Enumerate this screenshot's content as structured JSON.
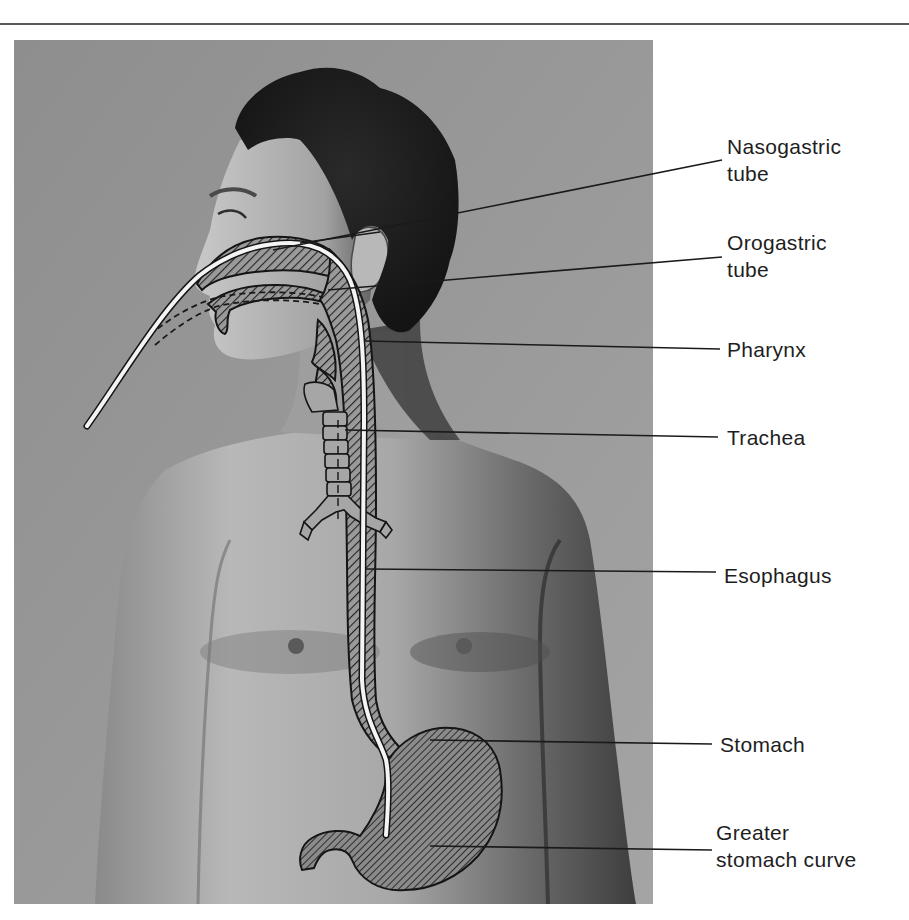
{
  "figure": {
    "type": "anatomical illustration",
    "photo_background_color": "#8f8f8f",
    "overlay_hatch_color": "#2a2a2a",
    "tube_color": "#f4f4f4"
  },
  "labels": [
    {
      "id": "nasogastric",
      "text": "Nasogastric\ntube",
      "x": 727,
      "y": 133
    },
    {
      "id": "orogastric",
      "text": "Orogastric\ntube",
      "x": 727,
      "y": 229
    },
    {
      "id": "pharynx",
      "text": "Pharynx",
      "x": 727,
      "y": 336
    },
    {
      "id": "trachea",
      "text": "Trachea",
      "x": 727,
      "y": 424
    },
    {
      "id": "esophagus",
      "text": "Esophagus",
      "x": 724,
      "y": 562
    },
    {
      "id": "stomach",
      "text": "Stomach",
      "x": 720,
      "y": 731
    },
    {
      "id": "greater_curve",
      "text": "Greater\nstomach curve",
      "x": 716,
      "y": 819
    }
  ]
}
